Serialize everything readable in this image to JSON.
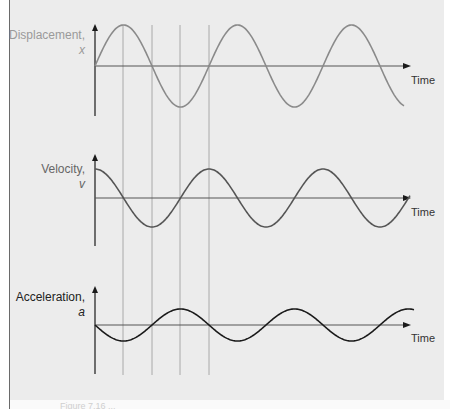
{
  "figure": {
    "background_color": "#ececec",
    "guide_lines_x": [
      123,
      152,
      180,
      209
    ],
    "caption": "Figure 7.16 ..."
  },
  "chart_data": [
    {
      "type": "line",
      "title": "Displacement, x",
      "ylabel": "Displacement, x",
      "xlabel": "Time",
      "function": "sin",
      "color": "#8a8a8a",
      "label_color": "#9a9a9a",
      "grid": false,
      "cycles_shown": 2.75,
      "amplitude_relative": 1.0
    },
    {
      "type": "line",
      "title": "Velocity, v",
      "ylabel": "Velocity, v",
      "xlabel": "Time",
      "function": "cos",
      "color": "#555555",
      "label_color": "#666666",
      "grid": false,
      "cycles_shown": 2.75,
      "amplitude_relative": 0.7
    },
    {
      "type": "line",
      "title": "Acceleration, a",
      "ylabel": "Acceleration, a",
      "xlabel": "Time",
      "function": "-sin",
      "color": "#1a1a1a",
      "label_color": "#222222",
      "grid": false,
      "cycles_shown": 2.8,
      "amplitude_relative": 0.4
    }
  ],
  "plots": [
    {
      "ylabel_name": "Displacement,",
      "ylabel_var": "x",
      "xlabel": "Time"
    },
    {
      "ylabel_name": "Velocity,",
      "ylabel_var": "v",
      "xlabel": "Time"
    },
    {
      "ylabel_name": "Acceleration,",
      "ylabel_var": "a",
      "xlabel": "Time"
    }
  ]
}
